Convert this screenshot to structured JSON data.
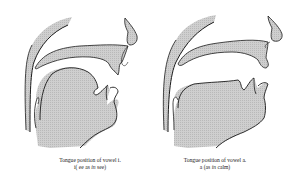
{
  "figure": {
    "panels": [
      {
        "id": "vowel-i",
        "caption_line1": "Tongue position of vowel i.",
        "caption_line2_pre": "i( ee as ",
        "caption_line2_em": "in",
        "caption_line2_post": " see)"
      },
      {
        "id": "vowel-a",
        "caption_line1": "Tongue position of vowel a.",
        "caption_line2_pre": "a (as ",
        "caption_line2_em": "in",
        "caption_line2_post": " calm)"
      }
    ],
    "colors": {
      "fill": "#c8c8c8",
      "stroke": "#1a1a1a",
      "background": "#ffffff"
    }
  }
}
